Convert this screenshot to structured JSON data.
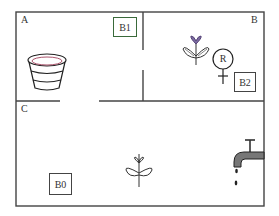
{
  "rooms": {
    "a": {
      "label": "A"
    },
    "b": {
      "label": "B"
    },
    "c": {
      "label": "C"
    }
  },
  "objects": {
    "b1": {
      "label": "B1"
    },
    "b2": {
      "label": "B2"
    },
    "b0": {
      "label": "B0"
    },
    "robot": {
      "label": "R"
    },
    "bucket": {
      "name": "bucket"
    },
    "plant_b": {
      "name": "plant"
    },
    "plant_c": {
      "name": "plant"
    },
    "faucet": {
      "name": "faucet"
    }
  },
  "colors": {
    "wall": "#444444",
    "b1_border": "#3a7a3a",
    "flower": "#7b6aa0",
    "bucket_rim": "#a0405a"
  }
}
